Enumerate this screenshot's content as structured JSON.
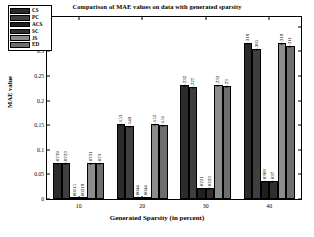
{
  "chart_data": {
    "type": "bar",
    "title": "Comparison of MAE values on data with generated sparsity",
    "xlabel": "Generated Sparsity (in percent)",
    "ylabel": "MAE value",
    "categories": [
      "10",
      "20",
      "30",
      "40"
    ],
    "ylim": [
      0,
      0.37
    ],
    "yticks": [
      "0",
      "0.05",
      "0.1",
      "0.15",
      "0.2",
      "0.25",
      "0.3",
      "0.35"
    ],
    "ytick_values": [
      0,
      0.05,
      0.1,
      0.15,
      0.2,
      0.25,
      0.3,
      0.35
    ],
    "grid": false,
    "legend_position": "upper-left-inside",
    "series": [
      {
        "name": "CS",
        "color": "#2b2b2b",
        "values": [
          0.0739,
          0.153,
          0.232,
          0.318
        ],
        "labels": [
          "0.0739",
          "0.153",
          "0.232",
          "0.318"
        ]
      },
      {
        "name": "PC",
        "color": "#3f3f3f",
        "values": [
          0.0723,
          0.149,
          0.227,
          0.305
        ],
        "labels": [
          "0.0723",
          "0.149",
          "0.227",
          "0.305"
        ]
      },
      {
        "name": "ACS",
        "color": "#1f1f1f",
        "values": [
          0.00115,
          0.0044,
          0.0221,
          0.0368
        ],
        "labels": [
          "0.00115",
          "0.0044",
          "0.0221",
          "0.0368"
        ]
      },
      {
        "name": "SC",
        "color": "#2f2f2f",
        "values": [
          0.00218,
          0.0044,
          0.0223,
          0.037
        ],
        "labels": [
          "0.00218",
          "0.0044",
          "0.0223",
          "0.037"
        ]
      },
      {
        "name": "JS",
        "color": "#8c8c8c",
        "values": [
          0.0731,
          0.152,
          0.232,
          0.318
        ],
        "labels": [
          "0.0731",
          "0.152",
          "0.232",
          "0.318"
        ]
      },
      {
        "name": "ED",
        "color": "#6e6e6e",
        "values": [
          0.073,
          0.151,
          0.23,
          0.311
        ],
        "labels": [
          "0.073",
          "0.151",
          "0.23",
          "0.311"
        ]
      }
    ]
  }
}
